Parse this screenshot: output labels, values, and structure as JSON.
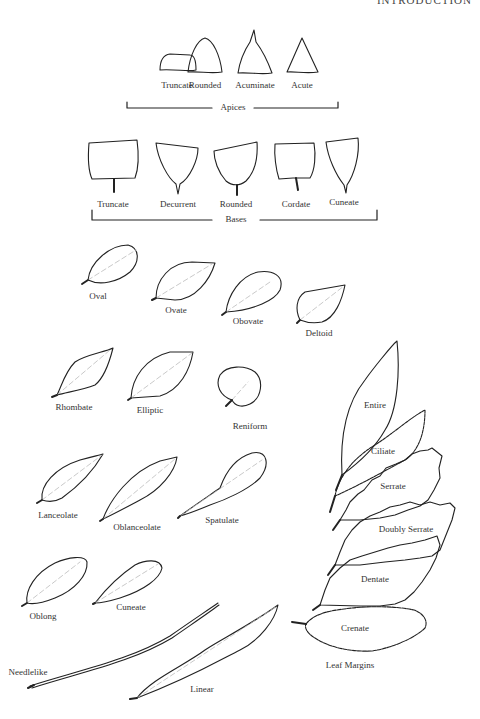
{
  "header": {
    "title": "INTRODUCTION"
  },
  "apices": {
    "group_label": "Apices",
    "items": [
      {
        "label": "Truncate"
      },
      {
        "label": "Rounded"
      },
      {
        "label": "Acuminate"
      },
      {
        "label": "Acute"
      }
    ]
  },
  "bases": {
    "group_label": "Bases",
    "items": [
      {
        "label": "Truncate"
      },
      {
        "label": "Decurrent"
      },
      {
        "label": "Rounded"
      },
      {
        "label": "Cordate"
      },
      {
        "label": "Cuneate"
      }
    ]
  },
  "shapes": {
    "items": [
      {
        "label": "Oval"
      },
      {
        "label": "Ovate"
      },
      {
        "label": "Obovate"
      },
      {
        "label": "Deltoid"
      },
      {
        "label": "Rhombate"
      },
      {
        "label": "Elliptic"
      },
      {
        "label": "Reniform"
      },
      {
        "label": "Lanceolate"
      },
      {
        "label": "Oblanceolate"
      },
      {
        "label": "Spatulate"
      },
      {
        "label": "Oblong"
      },
      {
        "label": "Cuneate"
      },
      {
        "label": "Needlelike"
      },
      {
        "label": "Linear"
      }
    ]
  },
  "margins": {
    "group_label": "Leaf Margins",
    "items": [
      {
        "label": "Entire"
      },
      {
        "label": "Ciliate"
      },
      {
        "label": "Serrate"
      },
      {
        "label": "Doubly Serrate"
      },
      {
        "label": "Dentate"
      },
      {
        "label": "Crenate"
      }
    ]
  }
}
